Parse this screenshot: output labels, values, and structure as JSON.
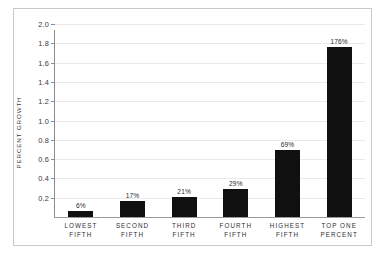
{
  "chart_data": {
    "type": "bar",
    "title": "",
    "xlabel": "",
    "ylabel": "PERCENT GROWTH",
    "ylim": [
      0,
      2.0
    ],
    "ytick_step": 0.2,
    "yticks": [
      "0.2",
      "0.4",
      "0.6",
      "0.8",
      "1.0",
      "1.2",
      "1.4",
      "1.6",
      "1.8",
      "2.0"
    ],
    "ytick_values": [
      0.2,
      0.4,
      0.6,
      0.8,
      1.0,
      1.2,
      1.4,
      1.6,
      1.8,
      2.0
    ],
    "grid": true,
    "legend": false,
    "categories": [
      "LOWEST FIFTH",
      "SECOND FIFTH",
      "THIRD FIFTH",
      "FOURTH FIFTH",
      "HIGHEST FIFTH",
      "TOP ONE PERCENT"
    ],
    "category_lines": [
      [
        "LOWEST",
        "FIFTH"
      ],
      [
        "SECOND",
        "FIFTH"
      ],
      [
        "THIRD",
        "FIFTH"
      ],
      [
        "FOURTH",
        "FIFTH"
      ],
      [
        "HIGHEST",
        "FIFTH"
      ],
      [
        "TOP ONE",
        "PERCENT"
      ]
    ],
    "values": [
      0.06,
      0.17,
      0.21,
      0.29,
      0.69,
      1.76
    ],
    "data_labels": [
      "6%",
      "17%",
      "21%",
      "29%",
      "69%",
      "176%"
    ],
    "bar_color": "#101010",
    "grid_color": "#eaeaec",
    "axis_color": "#8c8c90",
    "frame_color": "#c9c9cc",
    "background": "#ffffff"
  }
}
